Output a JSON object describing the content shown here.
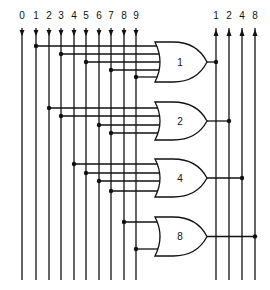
{
  "inputs": {
    "labels": [
      "0",
      "1",
      "2",
      "3",
      "4",
      "5",
      "6",
      "7",
      "8",
      "9"
    ],
    "x": [
      22,
      36,
      49,
      61,
      74,
      86,
      99,
      111,
      124,
      136
    ]
  },
  "outputs": {
    "labels": [
      "1",
      "2",
      "4",
      "8"
    ],
    "x": [
      216,
      229,
      242,
      255
    ]
  },
  "gates": [
    {
      "label": "1",
      "type": "OR",
      "top": 42,
      "bottom": 82,
      "inputs": [
        1,
        3,
        5,
        7,
        9
      ],
      "input_y": [
        46,
        54,
        62,
        70,
        77
      ],
      "output_index": 0
    },
    {
      "label": "2",
      "type": "OR",
      "top": 102,
      "bottom": 140,
      "inputs": [
        2,
        3,
        6,
        7
      ],
      "input_y": [
        108,
        116,
        125,
        133
      ],
      "output_index": 1
    },
    {
      "label": "4",
      "type": "OR",
      "top": 159,
      "bottom": 197,
      "inputs": [
        4,
        5,
        6,
        7
      ],
      "input_y": [
        164,
        173,
        181,
        191
      ],
      "output_index": 2
    },
    {
      "label": "8",
      "type": "OR",
      "top": 217,
      "bottom": 256,
      "inputs": [
        8,
        9
      ],
      "input_y": [
        222,
        249
      ],
      "output_index": 3
    }
  ],
  "colors": {
    "line": "#111111",
    "background": "#ffffff"
  }
}
